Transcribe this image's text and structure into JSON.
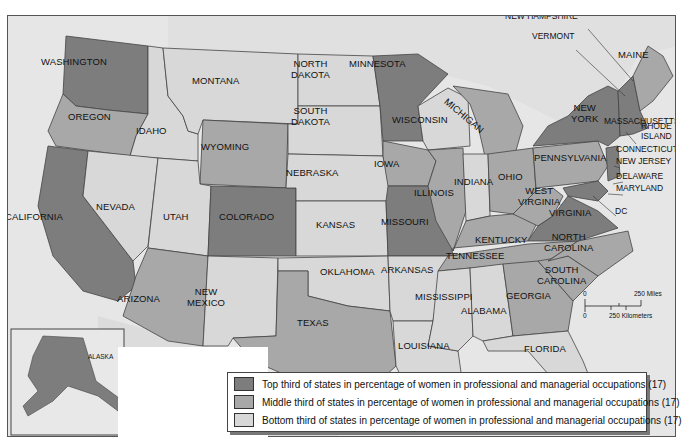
{
  "map": {
    "title": "Percentage of women in professional and managerial occupations by state",
    "colors": {
      "top": "#7d7d7d",
      "middle": "#a8a8a8",
      "bottom": "#d8d8d8",
      "water": "#e6e6e6",
      "frame": "#555555"
    },
    "states": {
      "washington": {
        "label": "WASHINGTON",
        "tier": "top"
      },
      "oregon": {
        "label": "OREGON",
        "tier": "middle"
      },
      "idaho": {
        "label": "IDAHO",
        "tier": "bottom"
      },
      "montana": {
        "label": "MONTANA",
        "tier": "bottom"
      },
      "wyoming": {
        "label": "WYOMING",
        "tier": "middle"
      },
      "north_dakota": {
        "label": "NORTH\nDAKOTA",
        "tier": "bottom"
      },
      "south_dakota": {
        "label": "SOUTH\nDAKOTA",
        "tier": "bottom"
      },
      "minnesota": {
        "label": "MINNESOTA",
        "tier": "top"
      },
      "wisconsin": {
        "label": "WISCONSIN",
        "tier": "bottom"
      },
      "michigan": {
        "label": "MICHIGAN",
        "tier": "middle"
      },
      "california": {
        "label": "CALIFORNIA",
        "tier": "top"
      },
      "nevada": {
        "label": "NEVADA",
        "tier": "bottom"
      },
      "utah": {
        "label": "UTAH",
        "tier": "bottom"
      },
      "colorado": {
        "label": "COLORADO",
        "tier": "top"
      },
      "nebraska": {
        "label": "NEBRASKA",
        "tier": "bottom"
      },
      "iowa": {
        "label": "IOWA",
        "tier": "middle"
      },
      "illinois": {
        "label": "ILLINOIS",
        "tier": "middle"
      },
      "indiana": {
        "label": "INDIANA",
        "tier": "bottom"
      },
      "ohio": {
        "label": "OHIO",
        "tier": "middle"
      },
      "kansas": {
        "label": "KANSAS",
        "tier": "bottom"
      },
      "missouri": {
        "label": "MISSOURI",
        "tier": "top"
      },
      "kentucky": {
        "label": "KENTUCKY",
        "tier": "middle"
      },
      "west_virginia": {
        "label": "WEST\nVIRGINIA",
        "tier": "middle"
      },
      "virginia": {
        "label": "VIRGINIA",
        "tier": "top"
      },
      "pennsylvania": {
        "label": "PENNSYLVANIA",
        "tier": "middle"
      },
      "new_york": {
        "label": "NEW\nYORK",
        "tier": "top"
      },
      "maine": {
        "label": "MAINE",
        "tier": "middle"
      },
      "arizona": {
        "label": "ARIZONA",
        "tier": "middle"
      },
      "new_mexico": {
        "label": "NEW\nMEXICO",
        "tier": "bottom"
      },
      "oklahoma": {
        "label": "OKLAHOMA",
        "tier": "bottom"
      },
      "arkansas": {
        "label": "ARKANSAS",
        "tier": "bottom"
      },
      "tennessee": {
        "label": "TENNESSEE",
        "tier": "middle"
      },
      "north_carolina": {
        "label": "NORTH\nCAROLINA",
        "tier": "middle"
      },
      "south_carolina": {
        "label": "SOUTH\nCAROLINA",
        "tier": "middle"
      },
      "georgia": {
        "label": "GEORGIA",
        "tier": "middle"
      },
      "texas": {
        "label": "TEXAS",
        "tier": "middle"
      },
      "mississippi": {
        "label": "MISSISSIPPI",
        "tier": "bottom"
      },
      "alabama": {
        "label": "ALABAMA",
        "tier": "bottom"
      },
      "louisiana": {
        "label": "LOUISIANA",
        "tier": "bottom"
      },
      "florida": {
        "label": "FLORIDA",
        "tier": "bottom"
      },
      "alaska": {
        "label": "ALASKA",
        "tier": "top"
      },
      "hawaii": {
        "label": "HAWAII",
        "tier": "bottom"
      }
    },
    "callouts": {
      "new_hampshire": "NEW HAMPSHIRE",
      "vermont": "VERMONT",
      "massachusetts": "MASSACHUSETTS",
      "rhode_island": "RHODE\nISLAND",
      "connecticut": "CONNECTICUT",
      "new_jersey": "NEW JERSEY",
      "delaware": "DELAWARE",
      "maryland": "MARYLAND",
      "dc": "DC"
    },
    "scale": {
      "zero_top": "0",
      "miles": "250 Miles",
      "zero_bottom": "0",
      "kilometers": "250 Kilometers"
    },
    "legend": {
      "items": [
        {
          "tier": "top",
          "label": "Top third of states in percentage of women in professional and managerial occupations (17)"
        },
        {
          "tier": "middle",
          "label": "Middle third of states in percentage of women in professional and managerial occupations (17)"
        },
        {
          "tier": "bottom",
          "label": "Bottom third of states in percentage of women in professional and managerial occupations (17)"
        }
      ]
    }
  }
}
